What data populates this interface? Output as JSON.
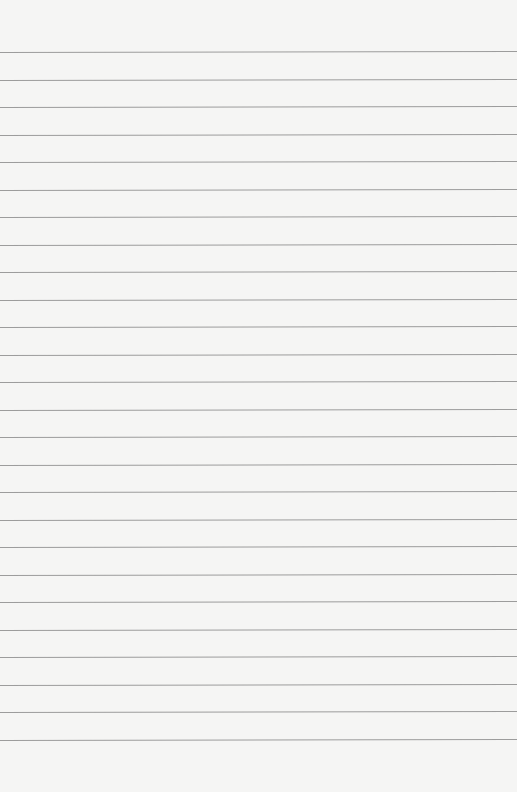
{
  "paper": {
    "background_color": "#f5f5f4",
    "line_color": "#9c9c9c",
    "first_line_y": 52,
    "line_spacing": 27.5,
    "line_count": 26
  }
}
